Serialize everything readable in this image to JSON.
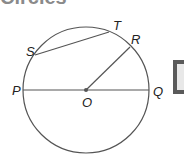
{
  "heading": {
    "text": "Circles"
  },
  "diagram": {
    "labels": {
      "P": "P",
      "Q": "Q",
      "O": "O",
      "R": "R",
      "S": "S",
      "T": "T"
    },
    "stroke_color": "#555555",
    "center": {
      "x": 86,
      "y": 90
    },
    "radius": 63
  }
}
